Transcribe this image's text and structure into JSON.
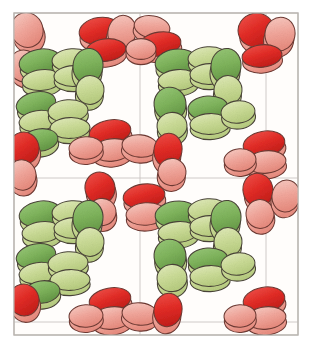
{
  "figure": {
    "kind": "crystal-packing-illustration",
    "caption": "",
    "background_color": "#ffffff",
    "frame": {
      "x": 14,
      "y": 13,
      "width": 284,
      "height": 322,
      "stroke_color": "#b9b4b0",
      "stroke_width": 1.1,
      "fill": "#fffdfb"
    },
    "unit_cell_grid": {
      "visible": true,
      "stroke_color": "#c9c4c2",
      "stroke_width": 0.9,
      "columns": 2,
      "rows": 2,
      "vertical_lines_x": [
        140,
        266
      ],
      "horizontal_lines_y": [
        178,
        322
      ]
    }
  },
  "palette": {
    "red_cap": "#e8352f",
    "red_cap_dark": "#cf2420",
    "red_body": "#f0a49a",
    "red_body_light": "#f6c4bb",
    "green_cap": "#7fb45c",
    "green_cap_dark": "#6aa049",
    "green_body": "#c7d98f",
    "green_body_light": "#dbe6ae",
    "outline": "#4a4438",
    "outline_red": "#6e3a33",
    "paper": "#fffdfb"
  },
  "legend": {
    "species": [
      {
        "name": "red-disc-molecule",
        "color": "#e8352f",
        "label": ""
      },
      {
        "name": "green-disc-molecule",
        "color": "#7fb45c",
        "label": ""
      }
    ]
  },
  "chart_data": {
    "type": "scatter",
    "title": "",
    "xlabel": "",
    "ylabel": "",
    "xlim": [
      14,
      298
    ],
    "ylim": [
      13,
      335
    ],
    "grid": true,
    "legend_position": "none",
    "discs": [
      {
        "cx": 27,
        "cy": 30,
        "rx": 16,
        "ry": 22,
        "rot": -18,
        "color": "red",
        "shade": "light",
        "depth": 10
      },
      {
        "cx": 24,
        "cy": 66,
        "rx": 15,
        "ry": 20,
        "rot": -12,
        "color": "red",
        "shade": "light",
        "depth": 9
      },
      {
        "cx": 100,
        "cy": 31,
        "rx": 21,
        "ry": 17,
        "rot": -8,
        "color": "red",
        "shade": "dark",
        "depth": 11
      },
      {
        "cx": 122,
        "cy": 32,
        "rx": 14,
        "ry": 21,
        "rot": 14,
        "color": "red",
        "shade": "light",
        "depth": 10
      },
      {
        "cx": 106,
        "cy": 50,
        "rx": 20,
        "ry": 14,
        "rot": -6,
        "color": "red",
        "shade": "dark",
        "depth": 9
      },
      {
        "cx": 152,
        "cy": 27,
        "rx": 18,
        "ry": 14,
        "rot": 10,
        "color": "red",
        "shade": "light",
        "depth": 9
      },
      {
        "cx": 160,
        "cy": 44,
        "rx": 21,
        "ry": 15,
        "rot": -8,
        "color": "red",
        "shade": "dark",
        "depth": 10
      },
      {
        "cx": 141,
        "cy": 49,
        "rx": 15,
        "ry": 13,
        "rot": 0,
        "color": "red",
        "shade": "light",
        "depth": 8
      },
      {
        "cx": 256,
        "cy": 30,
        "rx": 18,
        "ry": 21,
        "rot": -14,
        "color": "red",
        "shade": "dark",
        "depth": 11
      },
      {
        "cx": 280,
        "cy": 34,
        "rx": 15,
        "ry": 21,
        "rot": 12,
        "color": "red",
        "shade": "light",
        "depth": 10
      },
      {
        "cx": 262,
        "cy": 56,
        "rx": 20,
        "ry": 14,
        "rot": -6,
        "color": "red",
        "shade": "dark",
        "depth": 9
      },
      {
        "cx": 40,
        "cy": 62,
        "rx": 21,
        "ry": 16,
        "rot": -10,
        "color": "green",
        "shade": "dark",
        "depth": 10
      },
      {
        "cx": 42,
        "cy": 80,
        "rx": 20,
        "ry": 13,
        "rot": -6,
        "color": "green",
        "shade": "light",
        "depth": 9
      },
      {
        "cx": 72,
        "cy": 60,
        "rx": 20,
        "ry": 14,
        "rot": -4,
        "color": "green",
        "shade": "light",
        "depth": 9
      },
      {
        "cx": 74,
        "cy": 76,
        "rx": 20,
        "ry": 13,
        "rot": -2,
        "color": "green",
        "shade": "light",
        "depth": 8
      },
      {
        "cx": 88,
        "cy": 66,
        "rx": 15,
        "ry": 22,
        "rot": 8,
        "color": "green",
        "shade": "dark",
        "depth": 11
      },
      {
        "cx": 90,
        "cy": 90,
        "rx": 14,
        "ry": 18,
        "rot": 6,
        "color": "green",
        "shade": "light",
        "depth": 9
      },
      {
        "cx": 36,
        "cy": 104,
        "rx": 20,
        "ry": 15,
        "rot": -12,
        "color": "green",
        "shade": "dark",
        "depth": 10
      },
      {
        "cx": 38,
        "cy": 121,
        "rx": 19,
        "ry": 13,
        "rot": -8,
        "color": "green",
        "shade": "light",
        "depth": 9
      },
      {
        "cx": 68,
        "cy": 111,
        "rx": 20,
        "ry": 14,
        "rot": -4,
        "color": "green",
        "shade": "light",
        "depth": 9
      },
      {
        "cx": 70,
        "cy": 128,
        "rx": 20,
        "ry": 13,
        "rot": -2,
        "color": "green",
        "shade": "light",
        "depth": 8
      },
      {
        "cx": 40,
        "cy": 140,
        "rx": 18,
        "ry": 14,
        "rot": -8,
        "color": "green",
        "shade": "dark",
        "depth": 9
      },
      {
        "cx": 176,
        "cy": 62,
        "rx": 21,
        "ry": 16,
        "rot": -8,
        "color": "green",
        "shade": "dark",
        "depth": 10
      },
      {
        "cx": 178,
        "cy": 80,
        "rx": 20,
        "ry": 13,
        "rot": -4,
        "color": "green",
        "shade": "light",
        "depth": 9
      },
      {
        "cx": 208,
        "cy": 58,
        "rx": 20,
        "ry": 14,
        "rot": -4,
        "color": "green",
        "shade": "light",
        "depth": 9
      },
      {
        "cx": 210,
        "cy": 74,
        "rx": 20,
        "ry": 13,
        "rot": -2,
        "color": "green",
        "shade": "light",
        "depth": 8
      },
      {
        "cx": 226,
        "cy": 66,
        "rx": 15,
        "ry": 22,
        "rot": 8,
        "color": "green",
        "shade": "dark",
        "depth": 11
      },
      {
        "cx": 228,
        "cy": 90,
        "rx": 14,
        "ry": 18,
        "rot": 6,
        "color": "green",
        "shade": "light",
        "depth": 9
      },
      {
        "cx": 170,
        "cy": 104,
        "rx": 16,
        "ry": 21,
        "rot": -6,
        "color": "green",
        "shade": "dark",
        "depth": 10
      },
      {
        "cx": 172,
        "cy": 126,
        "rx": 15,
        "ry": 17,
        "rot": -4,
        "color": "green",
        "shade": "light",
        "depth": 9
      },
      {
        "cx": 208,
        "cy": 108,
        "rx": 20,
        "ry": 15,
        "rot": -4,
        "color": "green",
        "shade": "dark",
        "depth": 9
      },
      {
        "cx": 210,
        "cy": 124,
        "rx": 20,
        "ry": 13,
        "rot": -2,
        "color": "green",
        "shade": "light",
        "depth": 8
      },
      {
        "cx": 238,
        "cy": 112,
        "rx": 17,
        "ry": 14,
        "rot": -6,
        "color": "green",
        "shade": "light",
        "depth": 9
      },
      {
        "cx": 24,
        "cy": 148,
        "rx": 15,
        "ry": 20,
        "rot": -14,
        "color": "red",
        "shade": "dark",
        "depth": 10
      },
      {
        "cx": 22,
        "cy": 175,
        "rx": 14,
        "ry": 19,
        "rot": -10,
        "color": "red",
        "shade": "light",
        "depth": 9
      },
      {
        "cx": 110,
        "cy": 132,
        "rx": 21,
        "ry": 15,
        "rot": -10,
        "color": "red",
        "shade": "dark",
        "depth": 10
      },
      {
        "cx": 112,
        "cy": 150,
        "rx": 20,
        "ry": 14,
        "rot": -6,
        "color": "red",
        "shade": "light",
        "depth": 9
      },
      {
        "cx": 86,
        "cy": 148,
        "rx": 17,
        "ry": 14,
        "rot": -4,
        "color": "red",
        "shade": "light",
        "depth": 8
      },
      {
        "cx": 140,
        "cy": 146,
        "rx": 18,
        "ry": 14,
        "rot": 6,
        "color": "red",
        "shade": "light",
        "depth": 9
      },
      {
        "cx": 168,
        "cy": 150,
        "rx": 14,
        "ry": 21,
        "rot": 10,
        "color": "red",
        "shade": "dark",
        "depth": 11
      },
      {
        "cx": 172,
        "cy": 172,
        "rx": 14,
        "ry": 17,
        "rot": 8,
        "color": "red",
        "shade": "light",
        "depth": 9
      },
      {
        "cx": 264,
        "cy": 144,
        "rx": 21,
        "ry": 16,
        "rot": -10,
        "color": "red",
        "shade": "dark",
        "depth": 10
      },
      {
        "cx": 266,
        "cy": 162,
        "rx": 20,
        "ry": 14,
        "rot": -6,
        "color": "red",
        "shade": "light",
        "depth": 9
      },
      {
        "cx": 240,
        "cy": 160,
        "rx": 16,
        "ry": 14,
        "rot": -4,
        "color": "red",
        "shade": "light",
        "depth": 8
      },
      {
        "cx": 100,
        "cy": 188,
        "rx": 15,
        "ry": 20,
        "rot": -12,
        "color": "red",
        "shade": "dark",
        "depth": 10
      },
      {
        "cx": 102,
        "cy": 212,
        "rx": 14,
        "ry": 17,
        "rot": -8,
        "color": "red",
        "shade": "light",
        "depth": 9
      },
      {
        "cx": 144,
        "cy": 196,
        "rx": 21,
        "ry": 15,
        "rot": -8,
        "color": "red",
        "shade": "dark",
        "depth": 10
      },
      {
        "cx": 146,
        "cy": 214,
        "rx": 20,
        "ry": 14,
        "rot": -4,
        "color": "red",
        "shade": "light",
        "depth": 9
      },
      {
        "cx": 258,
        "cy": 190,
        "rx": 15,
        "ry": 21,
        "rot": -12,
        "color": "red",
        "shade": "dark",
        "depth": 11
      },
      {
        "cx": 260,
        "cy": 214,
        "rx": 14,
        "ry": 18,
        "rot": -8,
        "color": "red",
        "shade": "light",
        "depth": 9
      },
      {
        "cx": 286,
        "cy": 196,
        "rx": 14,
        "ry": 20,
        "rot": 10,
        "color": "red",
        "shade": "light",
        "depth": 9
      },
      {
        "cx": 40,
        "cy": 214,
        "rx": 21,
        "ry": 16,
        "rot": -10,
        "color": "green",
        "shade": "dark",
        "depth": 10
      },
      {
        "cx": 42,
        "cy": 232,
        "rx": 20,
        "ry": 13,
        "rot": -6,
        "color": "green",
        "shade": "light",
        "depth": 9
      },
      {
        "cx": 72,
        "cy": 212,
        "rx": 20,
        "ry": 14,
        "rot": -4,
        "color": "green",
        "shade": "light",
        "depth": 9
      },
      {
        "cx": 74,
        "cy": 228,
        "rx": 20,
        "ry": 13,
        "rot": -2,
        "color": "green",
        "shade": "light",
        "depth": 8
      },
      {
        "cx": 88,
        "cy": 218,
        "rx": 15,
        "ry": 22,
        "rot": 8,
        "color": "green",
        "shade": "dark",
        "depth": 11
      },
      {
        "cx": 90,
        "cy": 242,
        "rx": 14,
        "ry": 18,
        "rot": 6,
        "color": "green",
        "shade": "light",
        "depth": 9
      },
      {
        "cx": 36,
        "cy": 256,
        "rx": 20,
        "ry": 15,
        "rot": -12,
        "color": "green",
        "shade": "dark",
        "depth": 10
      },
      {
        "cx": 38,
        "cy": 273,
        "rx": 19,
        "ry": 13,
        "rot": -8,
        "color": "green",
        "shade": "light",
        "depth": 9
      },
      {
        "cx": 68,
        "cy": 263,
        "rx": 20,
        "ry": 14,
        "rot": -4,
        "color": "green",
        "shade": "light",
        "depth": 9
      },
      {
        "cx": 70,
        "cy": 280,
        "rx": 20,
        "ry": 13,
        "rot": -2,
        "color": "green",
        "shade": "light",
        "depth": 8
      },
      {
        "cx": 42,
        "cy": 292,
        "rx": 18,
        "ry": 14,
        "rot": -8,
        "color": "green",
        "shade": "dark",
        "depth": 9
      },
      {
        "cx": 176,
        "cy": 214,
        "rx": 21,
        "ry": 16,
        "rot": -8,
        "color": "green",
        "shade": "dark",
        "depth": 10
      },
      {
        "cx": 178,
        "cy": 232,
        "rx": 20,
        "ry": 13,
        "rot": -4,
        "color": "green",
        "shade": "light",
        "depth": 9
      },
      {
        "cx": 208,
        "cy": 210,
        "rx": 20,
        "ry": 14,
        "rot": -4,
        "color": "green",
        "shade": "light",
        "depth": 9
      },
      {
        "cx": 210,
        "cy": 226,
        "rx": 20,
        "ry": 13,
        "rot": -2,
        "color": "green",
        "shade": "light",
        "depth": 8
      },
      {
        "cx": 226,
        "cy": 218,
        "rx": 15,
        "ry": 22,
        "rot": 8,
        "color": "green",
        "shade": "dark",
        "depth": 11
      },
      {
        "cx": 228,
        "cy": 242,
        "rx": 14,
        "ry": 18,
        "rot": 6,
        "color": "green",
        "shade": "light",
        "depth": 9
      },
      {
        "cx": 170,
        "cy": 256,
        "rx": 16,
        "ry": 21,
        "rot": -6,
        "color": "green",
        "shade": "dark",
        "depth": 10
      },
      {
        "cx": 172,
        "cy": 278,
        "rx": 15,
        "ry": 17,
        "rot": -4,
        "color": "green",
        "shade": "light",
        "depth": 9
      },
      {
        "cx": 208,
        "cy": 260,
        "rx": 20,
        "ry": 15,
        "rot": -4,
        "color": "green",
        "shade": "dark",
        "depth": 9
      },
      {
        "cx": 210,
        "cy": 276,
        "rx": 20,
        "ry": 13,
        "rot": -2,
        "color": "green",
        "shade": "light",
        "depth": 8
      },
      {
        "cx": 238,
        "cy": 264,
        "rx": 17,
        "ry": 14,
        "rot": -6,
        "color": "green",
        "shade": "light",
        "depth": 9
      },
      {
        "cx": 24,
        "cy": 300,
        "rx": 15,
        "ry": 20,
        "rot": -14,
        "color": "red",
        "shade": "dark",
        "depth": 10
      },
      {
        "cx": 110,
        "cy": 300,
        "rx": 21,
        "ry": 15,
        "rot": -10,
        "color": "red",
        "shade": "dark",
        "depth": 10
      },
      {
        "cx": 112,
        "cy": 318,
        "rx": 20,
        "ry": 14,
        "rot": -6,
        "color": "red",
        "shade": "light",
        "depth": 9
      },
      {
        "cx": 86,
        "cy": 316,
        "rx": 17,
        "ry": 14,
        "rot": -4,
        "color": "red",
        "shade": "light",
        "depth": 8
      },
      {
        "cx": 140,
        "cy": 314,
        "rx": 18,
        "ry": 14,
        "rot": 6,
        "color": "red",
        "shade": "light",
        "depth": 9
      },
      {
        "cx": 168,
        "cy": 310,
        "rx": 14,
        "ry": 21,
        "rot": 10,
        "color": "red",
        "shade": "dark",
        "depth": 11
      },
      {
        "cx": 264,
        "cy": 300,
        "rx": 21,
        "ry": 16,
        "rot": -10,
        "color": "red",
        "shade": "dark",
        "depth": 10
      },
      {
        "cx": 266,
        "cy": 318,
        "rx": 20,
        "ry": 14,
        "rot": -6,
        "color": "red",
        "shade": "light",
        "depth": 9
      },
      {
        "cx": 240,
        "cy": 316,
        "rx": 16,
        "ry": 14,
        "rot": -4,
        "color": "red",
        "shade": "light",
        "depth": 8
      }
    ]
  }
}
